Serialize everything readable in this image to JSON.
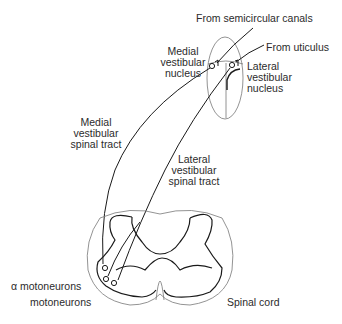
{
  "figure": {
    "labels": {
      "from_semicircular_canals": "From semicircular canals",
      "from_utriculus": "From uticulus",
      "medial_vestibular_nucleus": [
        "Medial",
        "vestibular",
        "nucleus"
      ],
      "lateral_vestibular_nucleus": [
        "Lateral",
        "vestibular",
        "nucleus"
      ],
      "medial_vestibular_spinal_tract": [
        "Medial",
        "vestibular",
        "spinal tract"
      ],
      "lateral_vestibular_spinal_tract": [
        "Lateral",
        "vestibular",
        "spinal tract"
      ],
      "alpha_motoneurons": "α motoneurons",
      "motoneurons": "motoneurons",
      "spinal_cord": "Spinal cord"
    },
    "colors": {
      "thick_line": "#1a1a1a",
      "thin_line": "#6e6e6e",
      "text": "#2b2b2b"
    }
  }
}
